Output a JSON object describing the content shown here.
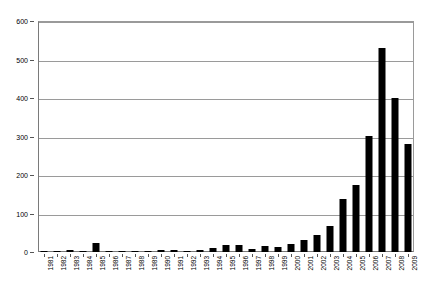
{
  "chart_data": {
    "type": "bar",
    "title": "",
    "subtitle": "",
    "xlabel": "",
    "ylabel": "",
    "ylim": [
      0,
      600
    ],
    "ytick_step": 100,
    "yticks": [
      0,
      100,
      200,
      300,
      400,
      500,
      600
    ],
    "ytick_labels": [
      "0",
      "100",
      "200",
      "300",
      "400",
      "500",
      "600"
    ],
    "grid": "horizontal",
    "legend": "none",
    "bar_color": "#000000",
    "plot_border_color": "#7a7a7a",
    "gridline_color": "#9a9a9a",
    "categories": [
      "1981",
      "1982",
      "1983",
      "1984",
      "1985",
      "1986",
      "1987",
      "1988",
      "1989",
      "1990",
      "1991",
      "1992",
      "1993",
      "1994",
      "1995",
      "1996",
      "1997",
      "1998",
      "1999",
      "2000",
      "2001",
      "2002",
      "2003",
      "2004",
      "2005",
      "2006",
      "2007",
      "2008",
      "2009"
    ],
    "values": [
      1,
      1,
      4,
      3,
      23,
      3,
      1,
      1,
      2,
      4,
      4,
      2,
      5,
      10,
      19,
      19,
      8,
      16,
      13,
      22,
      30,
      45,
      68,
      137,
      174,
      301,
      530,
      400,
      280
    ],
    "series": [
      {
        "name": "count",
        "values": [
          1,
          1,
          4,
          3,
          23,
          3,
          1,
          1,
          2,
          4,
          4,
          2,
          5,
          10,
          19,
          19,
          8,
          16,
          13,
          22,
          30,
          45,
          68,
          137,
          174,
          301,
          530,
          400,
          280
        ]
      }
    ]
  }
}
